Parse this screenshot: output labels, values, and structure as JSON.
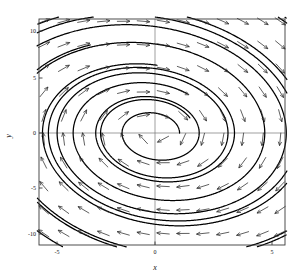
{
  "figure": {
    "kind": "phase-portrait",
    "background_color": "#ffffff",
    "ink_color": "#000000",
    "axis_color": "#555555",
    "frame": {
      "left": 39,
      "top": 19,
      "right": 285,
      "bottom": 245
    }
  },
  "axes": {
    "x_label": "x",
    "y_label": "y",
    "x_ticks": [
      {
        "value": -5,
        "label": "-5",
        "px": 57
      },
      {
        "value": 0,
        "label": "0",
        "px": 155
      },
      {
        "value": 5,
        "label": "5",
        "px": 272
      }
    ],
    "y_ticks": [
      {
        "value": 10,
        "label": "10",
        "px": 31
      },
      {
        "value": 5,
        "label": "5",
        "px": 78
      },
      {
        "value": 0,
        "label": "0",
        "px": 133
      },
      {
        "value": -5,
        "label": "-5",
        "px": 188
      },
      {
        "value": -10,
        "label": "-10",
        "px": 234
      }
    ],
    "x_range": [
      -6.3,
      5.7
    ],
    "y_range": [
      -11.6,
      12.2
    ],
    "grid": false,
    "zero_lines": true
  },
  "chart_data": {
    "type": "line",
    "title": "",
    "xlabel": "x",
    "ylabel": "y",
    "xlim": [
      -6.3,
      5.7
    ],
    "ylim": [
      -11.6,
      12.2
    ],
    "grid": false,
    "legend": "none",
    "system": {
      "equilibrium": {
        "x": 0.0,
        "y": 0.0,
        "type": "stable-spiral"
      },
      "x_dot": "y",
      "y_dot": "-0.30*y - 2.60*x",
      "rotation": "clockwise",
      "damping": 0.3,
      "omega": 1.612,
      "ellipse_tilt_deg": -22
    },
    "center_px": {
      "x": 155,
      "y": 133
    },
    "scale_px_per_unit": {
      "x": 23.4,
      "y": 10.25
    },
    "trajectories": [
      {
        "name": "orbit-1",
        "r0": 1.05,
        "theta0": 0.0,
        "turns": 3.6
      },
      {
        "name": "orbit-2",
        "r0": 1.75,
        "theta0": 0.55,
        "turns": 3.6
      },
      {
        "name": "orbit-3",
        "r0": 2.75,
        "theta0": 1.05,
        "turns": 3.4
      },
      {
        "name": "orbit-4",
        "r0": 4.1,
        "theta0": 1.55,
        "turns": 3.2
      },
      {
        "name": "orbit-5",
        "r0": 6.0,
        "theta0": 2.05,
        "turns": 3.0
      },
      {
        "name": "orbit-6",
        "r0": 8.6,
        "theta0": 2.55,
        "turns": 2.7
      },
      {
        "name": "orbit-7",
        "r0": 12.2,
        "theta0": 3.05,
        "turns": 2.4
      }
    ],
    "direction_field": {
      "x_samples": [
        -5.6,
        -4.75,
        -3.9,
        -3.05,
        -2.2,
        -1.35,
        -0.5,
        0.35,
        1.2,
        2.05,
        2.9,
        3.75,
        4.6,
        5.35
      ],
      "y_samples": [
        10.9,
        8.6,
        6.3,
        4.0,
        1.7,
        -0.6,
        -2.9,
        -5.2,
        -7.5,
        -9.8
      ],
      "arrow_length_px": 13,
      "arrow_style": "thin-line-with-v-head",
      "normalized": true
    }
  },
  "labels": {
    "tick_font_px": 6,
    "axis_font_px": 8
  }
}
